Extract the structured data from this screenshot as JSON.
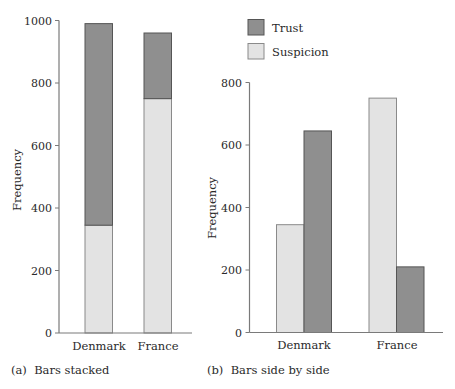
{
  "chart_data": [
    {
      "id": "a",
      "type": "bar",
      "mode": "stacked",
      "caption": "(a)  Bars stacked",
      "categories": [
        "Denmark",
        "France"
      ],
      "series": [
        {
          "name": "Suspicion",
          "values": [
            345,
            750
          ]
        },
        {
          "name": "Trust",
          "values": [
            645,
            210
          ]
        }
      ],
      "xlabel": "",
      "ylabel": "Frequency",
      "ylim": [
        0,
        1000
      ],
      "yticks": [
        0,
        200,
        400,
        600,
        800,
        1000
      ],
      "grid": false,
      "legend": "none"
    },
    {
      "id": "b",
      "type": "bar",
      "mode": "grouped",
      "caption": "(b)  Bars side by side",
      "categories": [
        "Denmark",
        "France"
      ],
      "series": [
        {
          "name": "Suspicion",
          "values": [
            345,
            750
          ]
        },
        {
          "name": "Trust",
          "values": [
            645,
            210
          ]
        }
      ],
      "xlabel": "",
      "ylabel": "Frequency",
      "ylim": [
        0,
        800
      ],
      "yticks": [
        0,
        200,
        400,
        600,
        800
      ],
      "grid": false,
      "legend": "top-left"
    }
  ],
  "legend": {
    "items": [
      {
        "name": "Trust",
        "color": "#8f8f8f",
        "stroke": "#555555"
      },
      {
        "name": "Suspicion",
        "color": "#e3e3e3",
        "stroke": "#8a8a8a"
      }
    ]
  },
  "colors": {
    "Trust": {
      "fill": "#8f8f8f",
      "stroke": "#555555"
    },
    "Suspicion": {
      "fill": "#e3e3e3",
      "stroke": "#8a8a8a"
    }
  }
}
